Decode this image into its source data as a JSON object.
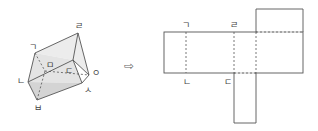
{
  "prism": {
    "labels": {
      "g": "ㄱ",
      "n": "ㄴ",
      "d": "ㄷ",
      "r": "ㄹ",
      "m": "ㅁ",
      "b": "ㅂ",
      "s": "ㅅ",
      "o": "ㅇ"
    }
  },
  "arrow": "⇨",
  "net": {
    "labels": {
      "top_left": "ㄱ",
      "top_mid": "ㄹ",
      "bottom_left": "ㄴ",
      "bottom_mid": "ㄷ"
    }
  },
  "colors": {
    "line": "#555555",
    "face_light": "#e6e6e6",
    "face_dark": "#cfcfcf"
  }
}
